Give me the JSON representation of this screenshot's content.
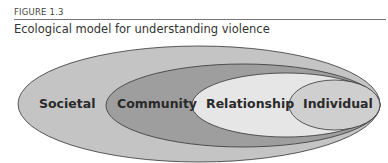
{
  "figure": {
    "number_label": "FIGURE 1.3",
    "title": "Ecological model for understanding violence"
  },
  "diagram": {
    "type": "nested-ellipses",
    "levels": [
      {
        "label": "Societal",
        "fill": "#c4c4c4"
      },
      {
        "label": "Community",
        "fill": "#9e9e9e"
      },
      {
        "label": "Relationship",
        "fill": "#e6e6e6"
      },
      {
        "label": "Individual",
        "fill": "#cfcfcf"
      }
    ]
  }
}
